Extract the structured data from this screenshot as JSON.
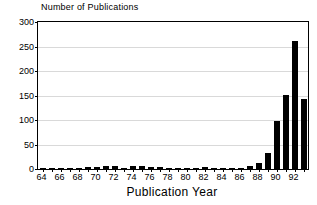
{
  "chart_data": {
    "type": "bar",
    "title": "",
    "xlabel": "Publication Year",
    "ylabel": "Number of Publications",
    "ylim": [
      0,
      300
    ],
    "yticks": [
      0,
      50,
      100,
      150,
      200,
      250,
      300
    ],
    "xticks": [
      64,
      66,
      68,
      70,
      72,
      74,
      76,
      78,
      80,
      82,
      84,
      86,
      88,
      90,
      92
    ],
    "grid": "horizontal",
    "legend": "none",
    "bar_color": "#000000",
    "categories": [
      "64",
      "65",
      "66",
      "67",
      "68",
      "69",
      "70",
      "71",
      "72",
      "73",
      "74",
      "75",
      "76",
      "77",
      "78",
      "79",
      "80",
      "81",
      "82",
      "83",
      "84",
      "85",
      "86",
      "87",
      "88",
      "89",
      "90",
      "91",
      "92",
      "93"
    ],
    "values": [
      1,
      1,
      1,
      1,
      1,
      5,
      4,
      6,
      6,
      3,
      6,
      6,
      4,
      5,
      2,
      3,
      3,
      2,
      4,
      2,
      3,
      2,
      1,
      7,
      12,
      32,
      99,
      152,
      262,
      143
    ]
  },
  "axes": {
    "y_title": "Number of Publications",
    "x_title": "Publication Year"
  }
}
